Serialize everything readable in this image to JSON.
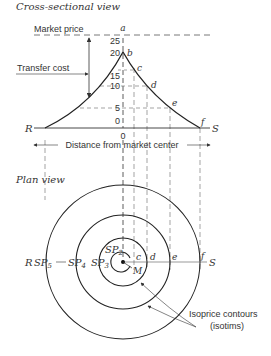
{
  "sections": {
    "cross_section_title": "Cross-sectional view",
    "plan_title": "Plan view"
  },
  "cross_section": {
    "market_price_label": "Market price",
    "transfer_cost_label": "Transfer cost",
    "axis_label": "Distance from market center",
    "origin_label": "0",
    "left_end": "R",
    "right_end": "S",
    "ticks": [
      "25",
      "20",
      "15",
      "10",
      "5",
      "0"
    ],
    "points": [
      "a",
      "b",
      "c",
      "d",
      "e",
      "f"
    ]
  },
  "plan": {
    "labels": {
      "R": "R",
      "S": "S",
      "M": "M",
      "c": "c",
      "d": "d",
      "e": "e",
      "f": "f"
    },
    "supply_points": [
      "SP",
      "SP",
      "SP",
      "SP"
    ],
    "supply_subscripts": [
      "5",
      "4",
      "3",
      "2"
    ],
    "contour_label_line1": "Isoprice contours",
    "contour_label_line2": "(isotims)"
  },
  "colors": {
    "ink": "#333333",
    "dash": "#555555"
  }
}
